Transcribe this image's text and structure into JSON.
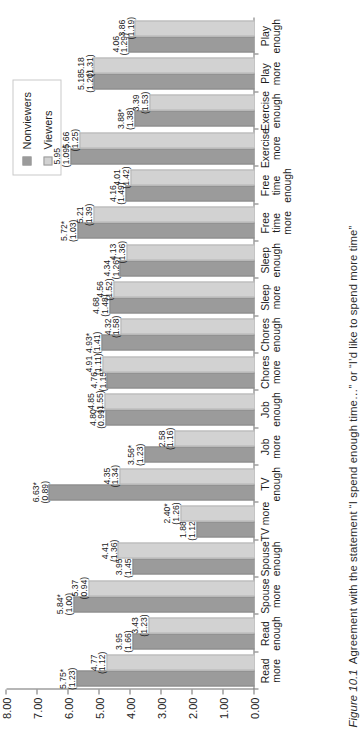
{
  "figure": {
    "number": "Figure 10.1",
    "caption": "Agreement with the statement “I spend enough time…” or “I’d like to spend more time”"
  },
  "legend": {
    "position": "top-right",
    "items": [
      {
        "label": "Nonviewers",
        "color": "#9b9b9b",
        "icon": "legend-swatch-icon"
      },
      {
        "label": "Viewers",
        "color": "#d2d2d2",
        "icon": "legend-swatch-icon"
      }
    ]
  },
  "axis": {
    "value_ticks": [
      "0.00",
      "1.00",
      "2.00",
      "3.00",
      "4.00",
      "5.00",
      "6.00",
      "7.00",
      "8.00"
    ],
    "min": 0,
    "max": 8,
    "grid": false
  },
  "chart_data": {
    "type": "bar",
    "orientation": "vertical-bars-on-rotated-page",
    "title": "",
    "xlabel": "",
    "ylabel": "",
    "ylim": [
      0,
      8
    ],
    "grid": false,
    "legend_position": "top-right",
    "categories": [
      "Read more",
      "Read enough",
      "Spouse more",
      "Spouse enough",
      "TV more",
      "TV enough",
      "Job more",
      "Job enough",
      "Chores more",
      "Chores enough",
      "Sleep more",
      "Sleep enough",
      "Free time more",
      "Free time enough",
      "Exercise more",
      "Exercise enough",
      "Play more",
      "Play enough"
    ],
    "category_lines": [
      [
        "Read",
        "more"
      ],
      [
        "Read",
        "enough"
      ],
      [
        "Spouse",
        "more"
      ],
      [
        "Spouse",
        "enough"
      ],
      [
        "TV more"
      ],
      [
        "TV",
        "enough"
      ],
      [
        "Job",
        "more"
      ],
      [
        "Job",
        "enough"
      ],
      [
        "Chores",
        "more"
      ],
      [
        "Chores",
        "enough"
      ],
      [
        "Sleep",
        "more"
      ],
      [
        "Sleep",
        "enough"
      ],
      [
        "Free",
        "time",
        "more"
      ],
      [
        "Free",
        "time",
        "enough"
      ],
      [
        "Exercise",
        "more"
      ],
      [
        "Exercise",
        "enough"
      ],
      [
        "Play",
        "more"
      ],
      [
        "Play",
        "enough"
      ]
    ],
    "series": [
      {
        "name": "Nonviewers",
        "color": "#9b9b9b",
        "values": [
          5.75,
          3.95,
          5.84,
          3.95,
          1.88,
          6.63,
          3.56,
          4.8,
          4.76,
          4.93,
          4.68,
          4.34,
          5.72,
          4.16,
          5.95,
          3.88,
          5.18,
          4.06
        ],
        "mean_labels": [
          "5.75*",
          "3.95",
          "5.84*",
          "3.95",
          "1.88",
          "6.63*",
          "3.56*",
          "4.80",
          "4.76",
          "4.93*",
          "4.68",
          "4.34",
          "5.72*",
          "4.16",
          "5.95",
          "3.88*",
          "5.18",
          "4.06"
        ],
        "sd_labels": [
          "(1.23)",
          "(1.66)",
          "(1.00)",
          "(1.45)",
          "(1.12)",
          "(0.89)",
          "(1.23)",
          "(0.99)",
          "(1.15)",
          "(1.41)",
          "(1.48)",
          "(1.26)",
          "(1.03)",
          "(1.49)",
          "(1.09)",
          "(1.38)",
          "(1.20)",
          "(1.29)"
        ]
      },
      {
        "name": "Viewers",
        "color": "#d2d2d2",
        "values": [
          4.77,
          3.43,
          5.37,
          4.41,
          2.4,
          4.35,
          2.58,
          4.85,
          4.91,
          4.32,
          4.56,
          4.13,
          5.21,
          4.01,
          5.66,
          3.39,
          5.18,
          3.86
        ],
        "mean_labels": [
          "4.77",
          "3.43",
          "5.37",
          "4.41",
          "2.40*",
          "4.35",
          "2.58",
          "4.85",
          "4.91",
          "4.32",
          "4.56",
          "4.13",
          "5.21",
          "4.01",
          "5.66",
          "3.39",
          "5.18",
          "3.86"
        ],
        "sd_labels": [
          "(1.12)",
          "(1.23)",
          "(0.94)",
          "(1.36)",
          "(1.26)",
          "(1.34)",
          "(1.16)",
          "(1.55)",
          "(1.11)",
          "(1.58)",
          "(1.52)",
          "(1.36)",
          "(1.39)",
          "(1.42)",
          "(1.25)",
          "(1.53)",
          "(1.31)",
          "(1.19)"
        ]
      }
    ]
  }
}
